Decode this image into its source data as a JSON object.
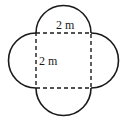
{
  "diagram": {
    "shape": "square-with-four-semicircles",
    "square": {
      "x": 36,
      "y": 33,
      "size": 55,
      "stroke": "dashed"
    },
    "labels": {
      "top_side": "2 m",
      "left_side": "2 m"
    },
    "colors": {
      "stroke": "#1a1a1a",
      "background": "#ffffff"
    }
  }
}
